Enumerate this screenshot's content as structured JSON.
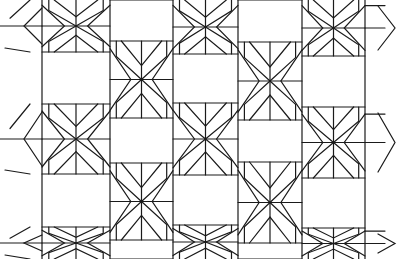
{
  "image": {
    "description": "Black line-art geometric tessellation of rectangles alternating with bow-tie chevron cells",
    "width": 406,
    "height": 259,
    "stroke_color": "#1a1a1a",
    "background": "#ffffff"
  },
  "grid": {
    "columns_x": [
      42,
      110,
      173,
      238,
      302,
      365
    ],
    "rect_cells": [
      {
        "col": "A",
        "x1": 42,
        "x2": 110,
        "y1": 52,
        "y2": 104
      },
      {
        "col": "A",
        "x1": 42,
        "x2": 110,
        "y1": 174,
        "y2": 227
      },
      {
        "col": "B",
        "x1": 110,
        "x2": 173,
        "y1": 0,
        "y2": 41
      },
      {
        "col": "B",
        "x1": 110,
        "x2": 173,
        "y1": 118,
        "y2": 163
      },
      {
        "col": "B",
        "x1": 110,
        "x2": 173,
        "y1": 240,
        "y2": 259
      },
      {
        "col": "C",
        "x1": 173,
        "x2": 238,
        "y1": 54,
        "y2": 103
      },
      {
        "col": "C",
        "x1": 173,
        "x2": 238,
        "y1": 175,
        "y2": 225
      },
      {
        "col": "D",
        "x1": 238,
        "x2": 302,
        "y1": 0,
        "y2": 42
      },
      {
        "col": "D",
        "x1": 238,
        "x2": 302,
        "y1": 120,
        "y2": 162
      },
      {
        "col": "D",
        "x1": 238,
        "x2": 302,
        "y1": 243,
        "y2": 259
      },
      {
        "col": "E",
        "x1": 302,
        "x2": 365,
        "y1": 56,
        "y2": 107
      },
      {
        "col": "E",
        "x1": 302,
        "x2": 365,
        "y1": 178,
        "y2": 228
      }
    ]
  }
}
